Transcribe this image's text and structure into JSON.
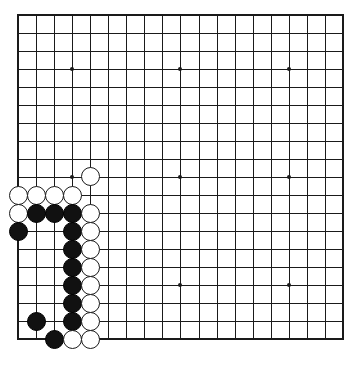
{
  "figure": {
    "kind": "go-board-diagram",
    "board_size": 19,
    "background_color": "#ffffff",
    "line_color": "#1a1a1a",
    "black_stone_color": "#111111",
    "white_stone_color": "#ffffff"
  },
  "geometry": {
    "origin_x": 18,
    "origin_y": 14.5,
    "spacing": 18.05,
    "stone_diameter": 19,
    "star_radius": 2
  },
  "star_points": [
    {
      "col": 4,
      "row": 4
    },
    {
      "col": 10,
      "row": 4
    },
    {
      "col": 16,
      "row": 4
    },
    {
      "col": 4,
      "row": 10
    },
    {
      "col": 10,
      "row": 10
    },
    {
      "col": 16,
      "row": 10
    },
    {
      "col": 4,
      "row": 16
    },
    {
      "col": 10,
      "row": 16
    },
    {
      "col": 16,
      "row": 16
    }
  ],
  "stones": [
    {
      "col": 5,
      "row": 10,
      "color": "white"
    },
    {
      "col": 1,
      "row": 11,
      "color": "white"
    },
    {
      "col": 2,
      "row": 11,
      "color": "white"
    },
    {
      "col": 3,
      "row": 11,
      "color": "white"
    },
    {
      "col": 4,
      "row": 11,
      "color": "white"
    },
    {
      "col": 1,
      "row": 12,
      "color": "white"
    },
    {
      "col": 2,
      "row": 12,
      "color": "black"
    },
    {
      "col": 3,
      "row": 12,
      "color": "black"
    },
    {
      "col": 4,
      "row": 12,
      "color": "black"
    },
    {
      "col": 5,
      "row": 12,
      "color": "white"
    },
    {
      "col": 1,
      "row": 13,
      "color": "black"
    },
    {
      "col": 4,
      "row": 13,
      "color": "black"
    },
    {
      "col": 5,
      "row": 13,
      "color": "white"
    },
    {
      "col": 4,
      "row": 14,
      "color": "black"
    },
    {
      "col": 5,
      "row": 14,
      "color": "white"
    },
    {
      "col": 4,
      "row": 15,
      "color": "black"
    },
    {
      "col": 5,
      "row": 15,
      "color": "white"
    },
    {
      "col": 4,
      "row": 16,
      "color": "black"
    },
    {
      "col": 5,
      "row": 16,
      "color": "white"
    },
    {
      "col": 4,
      "row": 17,
      "color": "black"
    },
    {
      "col": 5,
      "row": 17,
      "color": "white"
    },
    {
      "col": 2,
      "row": 18,
      "color": "black"
    },
    {
      "col": 4,
      "row": 18,
      "color": "black"
    },
    {
      "col": 5,
      "row": 18,
      "color": "white"
    },
    {
      "col": 3,
      "row": 19,
      "color": "black"
    },
    {
      "col": 4,
      "row": 19,
      "color": "white"
    },
    {
      "col": 5,
      "row": 19,
      "color": "white"
    }
  ]
}
